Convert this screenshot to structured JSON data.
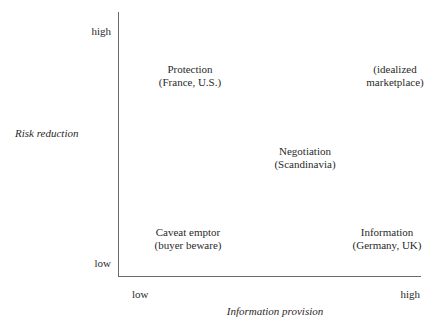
{
  "diagram": {
    "type": "2x2 quadrant matrix",
    "y_axis": {
      "label": "Risk reduction",
      "high": "high",
      "low": "low"
    },
    "x_axis": {
      "label": "Information provision",
      "low": "low",
      "high": "high"
    },
    "quadrants": [
      {
        "position": "top-left",
        "title": "Protection",
        "subtitle": "(France, U.S.)"
      },
      {
        "position": "top-right",
        "title": "(idealized",
        "subtitle": "marketplace)"
      },
      {
        "position": "center",
        "title": "Negotiation",
        "subtitle": "(Scandinavia)"
      },
      {
        "position": "bottom-left",
        "title": "Caveat emptor",
        "subtitle": "(buyer beware)"
      },
      {
        "position": "bottom-right",
        "title": "Information",
        "subtitle": "(Germany, UK)"
      }
    ]
  }
}
